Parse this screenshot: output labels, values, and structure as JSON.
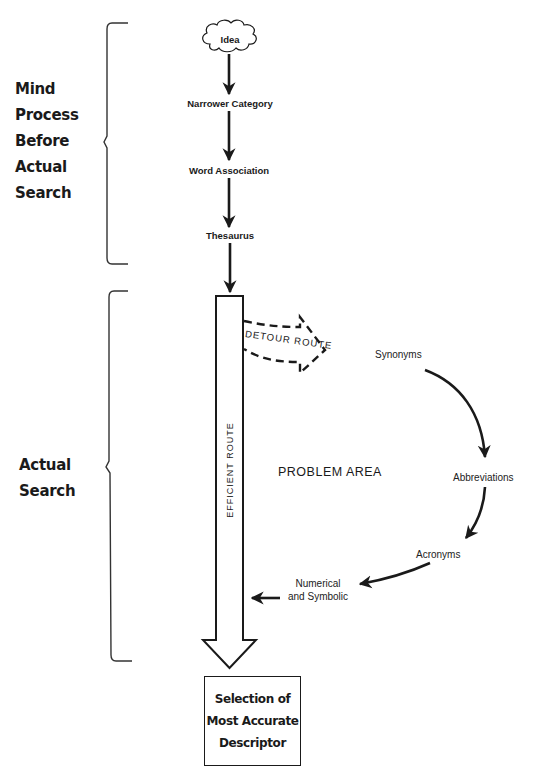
{
  "diagram": {
    "phases": {
      "before_search": {
        "label_lines": [
          "Mind",
          "Process",
          "Before",
          "Actual",
          "Search"
        ]
      },
      "actual_search": {
        "label_lines": [
          "Actual",
          "Search"
        ]
      }
    },
    "mind_process_nodes": [
      {
        "id": "idea",
        "label": "Idea",
        "shape": "cloud"
      },
      {
        "id": "narrower",
        "label": "Narrower Category"
      },
      {
        "id": "word-assoc",
        "label": "Word Association"
      },
      {
        "id": "thesaurus",
        "label": "Thesaurus"
      }
    ],
    "routes": {
      "efficient": "EFFICIENT ROUTE",
      "detour": "DETOUR ROUTE"
    },
    "problem_area": {
      "label": "PROBLEM AREA",
      "nodes": [
        {
          "id": "synonyms",
          "label": "Synonyms"
        },
        {
          "id": "abbreviations",
          "label": "Abbreviations"
        },
        {
          "id": "acronyms",
          "label": "Acronyms"
        },
        {
          "id": "numerical",
          "label_lines": [
            "Numerical",
            "and Symbolic"
          ]
        }
      ]
    },
    "outcome": {
      "label_lines": [
        "Selection of",
        "Most Accurate",
        "Descriptor"
      ]
    },
    "edges": [
      [
        "idea",
        "narrower"
      ],
      [
        "narrower",
        "word-assoc"
      ],
      [
        "word-assoc",
        "thesaurus"
      ],
      [
        "thesaurus",
        "efficient-route"
      ],
      [
        "efficient-route",
        "detour-route"
      ],
      [
        "detour-route",
        "synonyms"
      ],
      [
        "synonyms",
        "abbreviations"
      ],
      [
        "abbreviations",
        "acronyms"
      ],
      [
        "acronyms",
        "numerical"
      ],
      [
        "numerical",
        "efficient-route"
      ],
      [
        "efficient-route",
        "outcome"
      ]
    ],
    "colors": {
      "ink": "#1a1a1a",
      "background": "#ffffff"
    }
  }
}
